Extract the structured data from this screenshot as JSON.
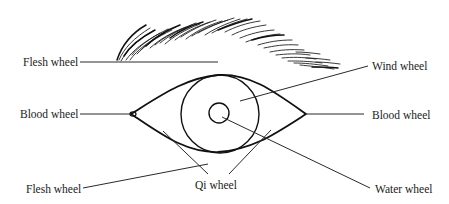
{
  "diagram": {
    "labels": {
      "flesh_top": "Flesh wheel",
      "wind": "Wind wheel",
      "blood_left": "Blood wheel",
      "blood_right": "Blood wheel",
      "flesh_bottom": "Flesh wheel",
      "qi": "Qi wheel",
      "water": "Water wheel"
    },
    "parts": [
      {
        "name": "eyebrow",
        "type": "hatched-arc"
      },
      {
        "name": "eyelid-outline",
        "type": "almond"
      },
      {
        "name": "iris",
        "type": "circle"
      },
      {
        "name": "pupil",
        "type": "circle"
      }
    ],
    "colors": {
      "stroke": "#111111",
      "text": "#1a1a1a",
      "background": "#ffffff"
    }
  }
}
